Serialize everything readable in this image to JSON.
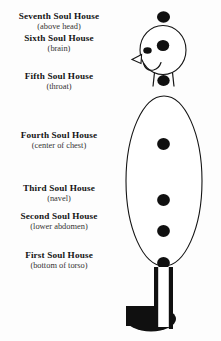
{
  "document": {
    "title": "Seven Soul Houses",
    "ink_color": "#141414",
    "background_color": "#fdfdfd"
  },
  "labels": [
    {
      "id": "seventh",
      "title": "Seventh Soul House",
      "location": "(above head)"
    },
    {
      "id": "sixth",
      "title": "Sixth Soul House",
      "location": "(brain)"
    },
    {
      "id": "fifth",
      "title": "Fifth Soul House",
      "location": "(throat)"
    },
    {
      "id": "fourth",
      "title": "Fourth Soul House",
      "location": "(center of chest)"
    },
    {
      "id": "third",
      "title": "Third Soul House",
      "location": "(navel)"
    },
    {
      "id": "second",
      "title": "Second Soul House",
      "location": "(lower abdomen)"
    },
    {
      "id": "first",
      "title": "First Soul House",
      "location": "(bottom of torso)"
    }
  ],
  "figure": {
    "name": "human-figure-with-soul-house-points",
    "parts": [
      "crown-point",
      "head-outline",
      "brow-point",
      "eye",
      "nose",
      "smile",
      "neck",
      "throat-point",
      "torso-outline",
      "chest-point",
      "navel-point",
      "lower-abdomen-point",
      "base-point",
      "legs",
      "foot-shadow"
    ],
    "point_count": 7
  }
}
